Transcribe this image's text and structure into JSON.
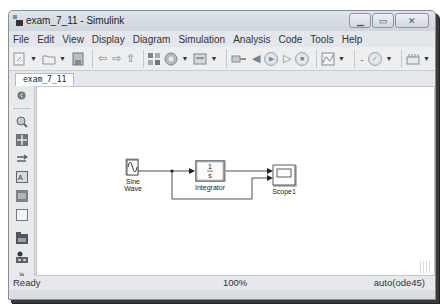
{
  "window": {
    "title": "exam_7_11 - Simulink",
    "controls": {
      "minimize": "minimize",
      "maximize": "maximize",
      "close": "close"
    }
  },
  "menubar": {
    "items": [
      "File",
      "Edit",
      "View",
      "Display",
      "Diagram",
      "Simulation",
      "Analysis",
      "Code",
      "Tools",
      "Help"
    ]
  },
  "toolbar": {
    "icons": [
      "new-model-icon",
      "open-icon",
      "save-icon",
      "back-icon",
      "forward-icon",
      "up-icon",
      "library-browser-icon",
      "model-settings-icon",
      "model-explorer-icon",
      "update-icon",
      "step-back-icon",
      "run-icon",
      "step-forward-icon",
      "stop-icon",
      "scope-icon",
      "stop-time-field",
      "check-icon",
      "build-icon"
    ]
  },
  "tabs": [
    {
      "label": "exam_7_11"
    }
  ],
  "palette": {
    "icons": [
      "hide-explorer-icon",
      "zoom-icon",
      "fit-view-icon",
      "arrow-icon",
      "annotation-icon",
      "image-icon",
      "area-icon",
      "model-browser-icon",
      "subsystem-icon",
      "more-icon"
    ]
  },
  "diagram": {
    "blocks": [
      {
        "name": "Sine Wave",
        "type": "source"
      },
      {
        "name": "Integrator",
        "type": "integrator",
        "glyph_num": "1",
        "glyph_den": "s"
      },
      {
        "name": "Scope1",
        "type": "scope"
      }
    ],
    "lines": [
      {
        "from": "Sine Wave",
        "to": "Integrator"
      },
      {
        "from": "Integrator",
        "to": "Scope1 port 1"
      },
      {
        "from": "Sine Wave (branch)",
        "to": "Scope1 port 2"
      }
    ]
  },
  "statusbar": {
    "status": "Ready",
    "zoom": "100%",
    "solver": "auto(ode45)"
  }
}
